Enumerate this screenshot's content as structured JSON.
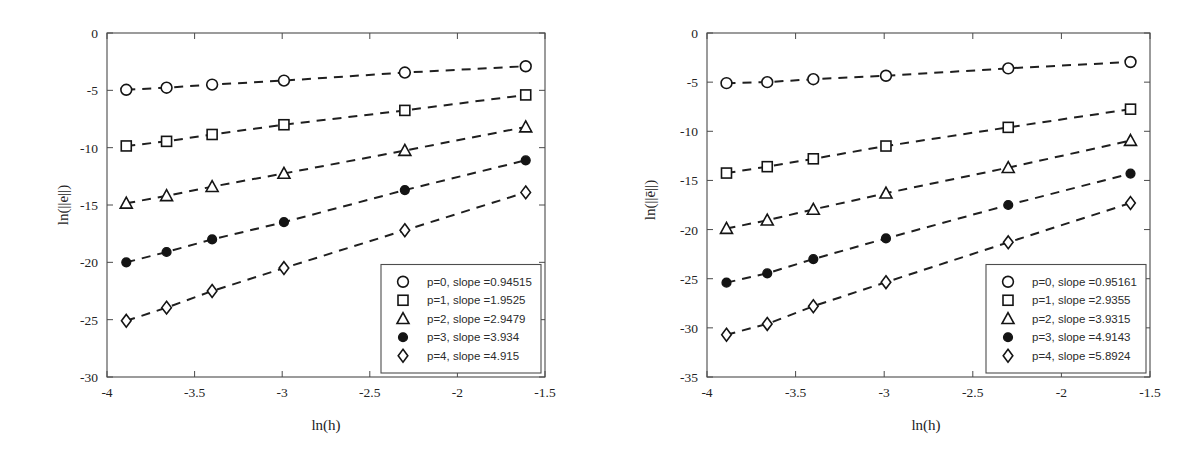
{
  "figure": {
    "panel_count": 2,
    "background": "#ffffff",
    "line_color": "#1f1f1f"
  },
  "chart_data": [
    {
      "type": "line",
      "panel": "left",
      "title": "",
      "xlabel": "ln(h)",
      "ylabel": "ln(||e||)",
      "xlim": [
        -4,
        -1.5
      ],
      "ylim": [
        -30,
        0
      ],
      "xticks": [
        -4,
        -3.5,
        -3,
        -2.5,
        -2,
        -1.5
      ],
      "xticklabels": [
        "-4",
        "-3.5",
        "-3",
        "-2.5",
        "-2",
        "-1.5"
      ],
      "yticks": [
        0,
        -5,
        -10,
        -15,
        -20,
        -25,
        -30
      ],
      "yticklabels": [
        "0",
        "-5",
        "-10",
        "-15",
        "-20",
        "-25",
        "-30"
      ],
      "grid": false,
      "legend_position": "lower right",
      "x": [
        -3.89,
        -3.66,
        -3.4,
        -2.99,
        -2.3,
        -1.61
      ],
      "series": [
        {
          "name": "p=0, slope =0.94515",
          "marker": "circle-open",
          "slope": 0.94515,
          "values": [
            -4.95,
            -4.77,
            -4.5,
            -4.15,
            -3.45,
            -2.9
          ]
        },
        {
          "name": "p=1, slope =1.9525",
          "marker": "square-open",
          "slope": 1.9525,
          "values": [
            -9.85,
            -9.45,
            -8.85,
            -8.0,
            -6.75,
            -5.4
          ]
        },
        {
          "name": "p=2, slope =2.9479",
          "marker": "triangle-open",
          "slope": 2.9479,
          "values": [
            -14.85,
            -14.2,
            -13.4,
            -12.25,
            -10.25,
            -8.2
          ]
        },
        {
          "name": "p=3, slope =3.934",
          "marker": "circle-filled",
          "slope": 3.934,
          "values": [
            -20.0,
            -19.1,
            -18.0,
            -16.5,
            -13.7,
            -11.1
          ]
        },
        {
          "name": "p=4, slope =4.915",
          "marker": "diamond-open",
          "slope": 4.915,
          "values": [
            -25.1,
            -23.95,
            -22.5,
            -20.5,
            -17.2,
            -13.9
          ]
        }
      ]
    },
    {
      "type": "line",
      "panel": "right",
      "title": "",
      "xlabel": "ln(h)",
      "ylabel": "ln(||ē||)",
      "xlim": [
        -4,
        -1.5
      ],
      "ylim": [
        -35,
        0
      ],
      "xticks": [
        -4,
        -3.5,
        -3,
        -2.5,
        -2,
        -1.5
      ],
      "xticklabels": [
        "-4",
        "-3.5",
        "-3",
        "-2.5",
        "-2",
        "-1.5"
      ],
      "yticks": [
        0,
        -5,
        -10,
        -15,
        -20,
        -25,
        -30,
        -35
      ],
      "yticklabels": [
        "0",
        "-5",
        "-10",
        "-15",
        "-20",
        "-25",
        "-30",
        "-35"
      ],
      "grid": false,
      "legend_position": "lower right",
      "x": [
        -3.89,
        -3.66,
        -3.4,
        -2.99,
        -2.3,
        -1.61
      ],
      "series": [
        {
          "name": "p=0, slope =0.95161",
          "marker": "circle-open",
          "slope": 0.95161,
          "values": [
            -5.1,
            -5.0,
            -4.7,
            -4.35,
            -3.6,
            -2.95
          ]
        },
        {
          "name": "p=1, slope =2.9355",
          "marker": "square-open",
          "slope": 2.9355,
          "values": [
            -14.25,
            -13.6,
            -12.8,
            -11.5,
            -9.6,
            -7.75
          ]
        },
        {
          "name": "p=2, slope =3.9315",
          "marker": "triangle-open",
          "slope": 3.9315,
          "values": [
            -19.9,
            -19.05,
            -17.95,
            -16.3,
            -13.7,
            -10.95
          ]
        },
        {
          "name": "p=3, slope =4.9143",
          "marker": "circle-filled",
          "slope": 4.9143,
          "values": [
            -25.4,
            -24.45,
            -23.0,
            -20.9,
            -17.5,
            -14.3
          ]
        },
        {
          "name": "p=4, slope =5.8924",
          "marker": "diamond-open",
          "slope": 5.8924,
          "values": [
            -30.7,
            -29.6,
            -27.8,
            -25.35,
            -21.3,
            -17.3
          ]
        }
      ]
    }
  ]
}
